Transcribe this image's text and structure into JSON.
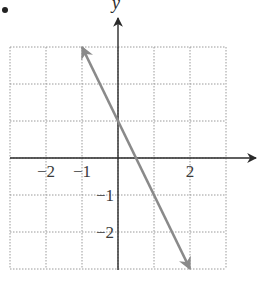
{
  "bullet": "•",
  "chart_data": {
    "type": "line",
    "title": "",
    "xlabel": "",
    "ylabel": "y",
    "xlim": [
      -3,
      3
    ],
    "ylim": [
      -3,
      3
    ],
    "grid": true,
    "grid_style": "dotted",
    "x_ticks": [
      {
        "value": -2,
        "label": "−2"
      },
      {
        "value": -1,
        "label": "−1"
      },
      {
        "value": 2,
        "label": "2"
      }
    ],
    "y_ticks": [
      {
        "value": -1,
        "label": "−1"
      },
      {
        "value": -2,
        "label": "−2"
      }
    ],
    "series": [
      {
        "name": "y = -2x + 1",
        "equation": "y = -2x + 1",
        "slope": -2,
        "intercept": 1,
        "x": [
          -1,
          2
        ],
        "y": [
          3,
          -3
        ],
        "arrows_both_ends": true,
        "color": "#8a8a8a"
      }
    ]
  },
  "colors": {
    "axis": "#2a2a2a",
    "grid": "#9a9a9a",
    "line": "#8a8a8a"
  }
}
